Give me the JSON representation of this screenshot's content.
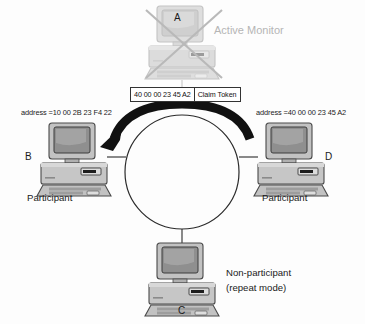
{
  "diagram": {
    "background_color": "#fdfdfd",
    "ring": {
      "type": "circle",
      "stroke_color": "#2b2b2b"
    },
    "token_band": {
      "color": "#111111",
      "direction": "from D clockwise over top to B"
    }
  },
  "frame": {
    "address": "40 00 00 23 45 A2",
    "type": "Claim Token"
  },
  "stations": {
    "a": {
      "id": "A",
      "role": "Active Monitor",
      "state": "failed",
      "marker": "x-cross"
    },
    "b": {
      "id": "B",
      "role": "Participant",
      "address_label": "address =10 00 2B 23 F4 22"
    },
    "c": {
      "id": "C",
      "role_line1": "Non-participant",
      "role_line2": "(repeat mode)"
    },
    "d": {
      "id": "D",
      "role": "Participant",
      "address_label": "address =40 00 00 23 45 A2"
    }
  },
  "colors": {
    "disabled_gray": "#b5b5b5",
    "case_gray": "#b9b9b9",
    "screen_gray": "#9a9a9a",
    "outline": "#4a4a4a",
    "token_black": "#111111"
  }
}
